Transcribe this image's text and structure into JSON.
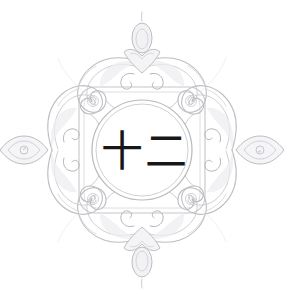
{
  "canvas": {
    "width": 285,
    "height": 304,
    "background_color": "#ffffff"
  },
  "artwork": {
    "kind": "ornamental-medallion",
    "title": "Decorative scroll medallion with Chinese numeral",
    "symmetry": "four-fold mirror (diamond)",
    "line_color_light": "#c8c8cd",
    "line_color_mid": "#b8b8bd",
    "line_color_dark": "#a8a8ae",
    "inner_circle": {
      "center_x": 142,
      "center_y": 150,
      "outer_radius": 50,
      "inner_radius": 46
    },
    "ornaments": [
      {
        "name": "top-crest",
        "position": "north",
        "finial": "teardrop"
      },
      {
        "name": "right-crest",
        "position": "east",
        "finial": "pointed-leaf"
      },
      {
        "name": "bottom-crest",
        "position": "south",
        "finial": "teardrop"
      },
      {
        "name": "left-crest",
        "position": "west",
        "finial": "pointed-leaf"
      }
    ]
  },
  "center_label": {
    "text": "十二",
    "characters": [
      "十",
      "二"
    ],
    "meaning": "twelve",
    "color": "#17171a",
    "font_size_px": 42
  }
}
